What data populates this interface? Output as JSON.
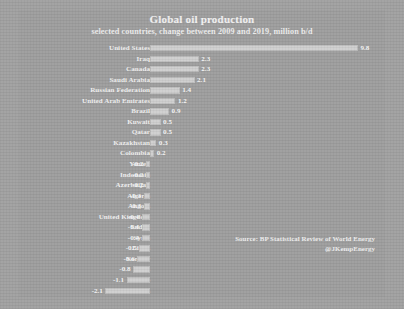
{
  "chart_data": {
    "type": "bar",
    "orientation": "horizontal",
    "title": "Global oil production",
    "subtitle": "selected countries, change between 2009 and 2019, million b/d",
    "xlabel": "",
    "ylabel": "",
    "xlim": [
      -2.1,
      9.8
    ],
    "grid": false,
    "legend": null,
    "value_unit": "million b/d",
    "categories": [
      "United States",
      "Iraq",
      "Canada",
      "Saudi Arabia",
      "Russian Federation",
      "United Arab Emirates",
      "Brazil",
      "Kuwait",
      "Qatar",
      "Kazakhstan",
      "Colombia",
      "Yemen",
      "Indonesia",
      "Azerbaijan",
      "Algeria",
      "Angola",
      "United Kingdom",
      "Sudan",
      "Syria",
      "Libya",
      "Norway",
      "Iran",
      "Mexico",
      "Venezuela"
    ],
    "values": [
      9.8,
      2.3,
      2.3,
      2.1,
      1.4,
      1.2,
      0.9,
      0.5,
      0.5,
      0.3,
      0.2,
      -0.2,
      -0.2,
      -0.2,
      -0.3,
      -0.3,
      -0.4,
      -0.4,
      -0.4,
      -0.5,
      -0.6,
      -0.8,
      -1.1,
      -2.1
    ],
    "value_labels": [
      "9.8",
      "2.3",
      "2.3",
      "2.1",
      "1.4",
      "1.2",
      "0.9",
      "0.5",
      "0.5",
      "0.3",
      "0.2",
      "-0.2",
      "-0.2",
      "-0.2",
      "-0.3",
      "-0.3",
      "-0.4",
      "-0.4",
      "-0.4",
      "-0.5",
      "-0.6",
      "-0.8",
      "-1.1",
      "-2.1"
    ]
  },
  "source_note": {
    "line1": "Source: BP Statistical Review of World Energy",
    "line2": "@JKempEnergy"
  },
  "colors": {
    "background": "#9d9d9d",
    "bar": "#cfcfcf",
    "text": "#f0f0f0"
  }
}
